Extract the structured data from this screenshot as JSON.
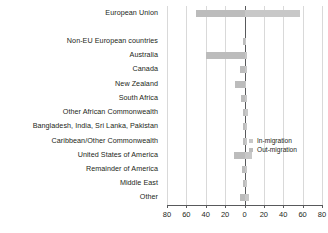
{
  "chart_data": {
    "type": "bar",
    "orientation": "horizontal",
    "title": "",
    "subtitle": "",
    "xlabel": "",
    "ylabel": "",
    "xlim": [
      -80,
      80
    ],
    "xticks": [
      -80,
      -60,
      -40,
      -20,
      0,
      20,
      40,
      60,
      80
    ],
    "xtick_labels": [
      "80",
      "60",
      "40",
      "20",
      "0",
      "20",
      "40",
      "60",
      "80"
    ],
    "grid": true,
    "legend_position": "center-right",
    "note": "Left of zero = Out-migration, right of zero = In-migration",
    "categories": [
      "European Union",
      "",
      "Non-EU European countries",
      "Australia",
      "Canada",
      "New Zealand",
      "South Africa",
      "Other African Commonwealth",
      "Bangladesh, India, Sri Lanka, Pakistan",
      "Caribbean/Other Commonwealth",
      "United States of America",
      "Remainder of America",
      "Middle East",
      "Other"
    ],
    "series": [
      {
        "name": "In-migration",
        "color": "#c8c8c8",
        "values": [
          57,
          0,
          2,
          3,
          3,
          2,
          3,
          4,
          3,
          3,
          8,
          3,
          3,
          5
        ]
      },
      {
        "name": "Out-migration",
        "color": "#bcbcbc",
        "values": [
          50,
          0,
          2,
          40,
          5,
          10,
          4,
          2,
          2,
          2,
          11,
          3,
          2,
          5
        ]
      }
    ]
  },
  "legend": {
    "items": [
      {
        "label": "In-migration",
        "color": "#c8c8c8"
      },
      {
        "label": "Out-migration",
        "color": "#bcbcbc"
      }
    ]
  },
  "colors": {
    "in_migration": "#c8c8c8",
    "out_migration": "#bcbcbc",
    "axis": "#58595b",
    "grid": "#d9d9d9",
    "text": "#231f20",
    "background": "#ffffff"
  }
}
